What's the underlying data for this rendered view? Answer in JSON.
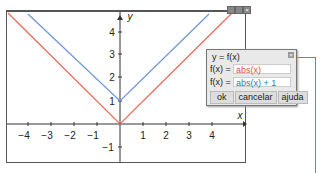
{
  "graph": {
    "x_axis_label": "x",
    "y_axis_label": "y",
    "x_ticks": [
      "−4",
      "−3",
      "−2",
      "−1",
      "1",
      "2",
      "3",
      "4"
    ],
    "y_ticks": [
      "4",
      "3",
      "2",
      "1",
      "−1"
    ],
    "window_buttons": [
      "_",
      "□",
      "×"
    ]
  },
  "dialog": {
    "title": "y = f(x)",
    "close": "×",
    "rows": [
      {
        "label": "f(x) =",
        "value": "abs(x)",
        "color": "#e0553a"
      },
      {
        "label": "f(x) =",
        "value": "abs(x) + 1",
        "color": "#3a6fc4"
      }
    ],
    "buttons": [
      "ok",
      "cancelar",
      "ajuda"
    ]
  },
  "colors": {
    "red_curve": "#e8684f",
    "blue_curve": "#6b94d6",
    "connector": "#4a90c8"
  }
}
